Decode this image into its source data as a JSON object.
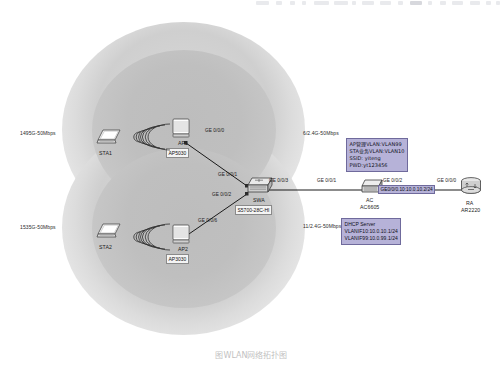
{
  "diagram": {
    "title": "图WLAN网络拓扑图",
    "coverage_labels": {
      "top_left": "1495G-50Mbps",
      "bottom_left": "1535G-50Mbps",
      "top_right": "6/2.4G-50Mbps",
      "bottom_right": "11/2.4G-50Mbps"
    },
    "devices": [
      {
        "id": "sta1",
        "name": "STA1",
        "model": "",
        "kind": "laptop"
      },
      {
        "id": "ap1",
        "name": "AP1",
        "model": "AP5030",
        "kind": "ap"
      },
      {
        "id": "sta2",
        "name": "STA2",
        "model": "",
        "kind": "laptop"
      },
      {
        "id": "ap2",
        "name": "AP2",
        "model": "AP3030",
        "kind": "ap"
      },
      {
        "id": "swa",
        "name": "SWA",
        "model": "S5700-28C-HI",
        "kind": "switch"
      },
      {
        "id": "ac",
        "name": "AC",
        "model": "AC6605",
        "kind": "ac"
      },
      {
        "id": "ra",
        "name": "RA",
        "model": "AR2220",
        "kind": "router"
      }
    ],
    "port_labels": [
      {
        "id": "p-ap1-ge000",
        "text": "GE 0/0/0"
      },
      {
        "id": "p-swa-ge001",
        "text": "GE 0/0/1"
      },
      {
        "id": "p-swa-ge002",
        "text": "GE 0/0/2"
      },
      {
        "id": "p-ap2-ge006",
        "text": "GE 0/0/6"
      },
      {
        "id": "p-swa-ge003",
        "text": "GE 0/0/3"
      },
      {
        "id": "p-ac-ge001",
        "text": "GE 0/0/1"
      },
      {
        "id": "p-ac-ge002",
        "text": "GE 0/0/2"
      },
      {
        "id": "p-ra-ge000",
        "text": "GE 0/0/0"
      }
    ],
    "link_ip_label": "GE0/0/0.10:10.0.10.2/24",
    "notes": [
      {
        "id": "wlan-params",
        "lines": [
          "AP管理VLAN:VLAN99",
          "STA业务VLAN:VLAN10",
          "SSID: yiteng",
          "PWD:yt123456"
        ]
      },
      {
        "id": "dhcp-server",
        "lines": [
          "DHCP Server",
          "VLANIF10:10.0.10.1/24",
          "VLANIF99:10.0.99.1/24"
        ]
      }
    ]
  }
}
